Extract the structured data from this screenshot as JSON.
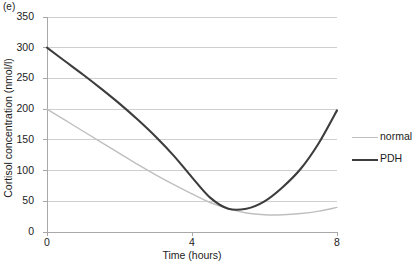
{
  "panel": {
    "label": "(e)"
  },
  "chart_data": {
    "type": "line",
    "title": "",
    "xlabel": "Time (hours)",
    "ylabel": "Cortisol concentration (nmol/l)",
    "xlim": [
      0,
      8
    ],
    "ylim": [
      0,
      350
    ],
    "xticks": [
      0,
      4,
      8
    ],
    "xticklabels": [
      "0",
      "4",
      "8"
    ],
    "yticks": [
      0,
      50,
      100,
      150,
      200,
      250,
      300,
      350
    ],
    "yticklabels": [
      "0",
      "50",
      "100",
      "150",
      "200",
      "250",
      "300",
      "350"
    ],
    "grid": "horizontal",
    "legend_position": "right",
    "x": [
      0,
      0.5,
      1,
      1.5,
      2,
      2.5,
      3,
      3.5,
      4,
      4.5,
      5,
      5.5,
      6,
      6.5,
      7,
      7.5,
      8
    ],
    "series": [
      {
        "name": "normal",
        "color": "#bfbfbf",
        "linewidth": 1.4,
        "values": [
          200,
          182,
          164,
          146,
          128,
          110,
          93,
          77,
          62,
          48,
          38,
          31,
          28,
          28,
          30,
          34,
          40
        ]
      },
      {
        "name": "PDH",
        "color": "#3d3d3d",
        "linewidth": 2.1,
        "values": [
          300,
          278,
          256,
          233,
          209,
          183,
          155,
          124,
          89,
          56,
          38,
          38,
          50,
          73,
          103,
          145,
          198
        ]
      }
    ]
  },
  "legend": {
    "items": [
      {
        "label": "normal",
        "key": "normal"
      },
      {
        "label": "PDH",
        "key": "pdh"
      }
    ]
  }
}
